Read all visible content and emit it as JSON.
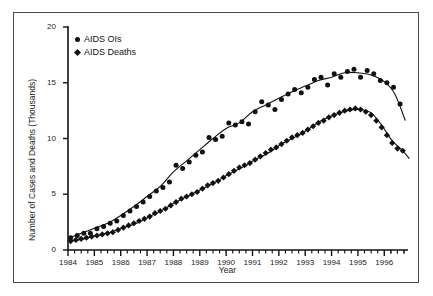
{
  "chart_data": {
    "type": "scatter",
    "title": "",
    "xlabel": "Year",
    "ylabel": "Number of Cases and Deaths (Thousands)",
    "xlim": [
      1984.0,
      1996.9
    ],
    "ylim": [
      0,
      20
    ],
    "yticks": [
      0,
      5,
      10,
      15,
      20
    ],
    "ytick_labels": [
      "0",
      "5",
      "10",
      "15",
      "20"
    ],
    "xticks": [
      1984,
      1985,
      1986,
      1987,
      1988,
      1989,
      1990,
      1991,
      1992,
      1993,
      1994,
      1995,
      1996
    ],
    "xtick_labels": [
      "1984",
      "1985",
      "1986",
      "1987",
      "1988",
      "1989",
      "1990",
      "1991",
      "1992",
      "1993",
      "1994",
      "1995",
      "1996"
    ],
    "minor_xticks_per_year": 4,
    "grid": false,
    "legend_position": "upper left",
    "marker_color": "#111111",
    "trend_line_color": "#111111",
    "series": [
      {
        "name": "AIDS OIs",
        "marker": "circle",
        "x": [
          1984.1,
          1984.35,
          1984.6,
          1984.85,
          1985.1,
          1985.35,
          1985.6,
          1985.85,
          1986.1,
          1986.35,
          1986.6,
          1986.85,
          1987.1,
          1987.35,
          1987.6,
          1987.85,
          1988.1,
          1988.35,
          1988.6,
          1988.85,
          1989.1,
          1989.35,
          1989.6,
          1989.85,
          1990.1,
          1990.35,
          1990.6,
          1990.85,
          1991.1,
          1991.35,
          1991.6,
          1991.85,
          1992.1,
          1992.35,
          1992.6,
          1992.85,
          1993.1,
          1993.35,
          1993.6,
          1993.85,
          1994.1,
          1994.35,
          1994.6,
          1994.85,
          1995.1,
          1995.35,
          1995.6,
          1995.85,
          1996.1,
          1996.35,
          1996.6
        ],
        "y": [
          1.1,
          1.3,
          1.5,
          1.5,
          1.9,
          2.1,
          2.4,
          2.6,
          3.1,
          3.5,
          3.9,
          4.3,
          4.8,
          5.3,
          5.6,
          6.1,
          7.6,
          7.3,
          7.9,
          8.5,
          8.8,
          10.1,
          9.9,
          10.2,
          11.4,
          11.2,
          11.5,
          11.3,
          12.4,
          13.3,
          13.0,
          12.6,
          13.5,
          14.0,
          14.4,
          14.1,
          14.6,
          15.3,
          15.5,
          14.8,
          15.8,
          15.5,
          16.0,
          16.2,
          15.5,
          16.1,
          15.8,
          15.2,
          15.0,
          14.6,
          13.1
        ]
      },
      {
        "name": "AIDS Deaths",
        "marker": "diamond",
        "x": [
          1984.1,
          1984.3,
          1984.5,
          1984.7,
          1984.9,
          1985.1,
          1985.3,
          1985.5,
          1985.7,
          1985.9,
          1986.1,
          1986.3,
          1986.5,
          1986.7,
          1986.9,
          1987.1,
          1987.3,
          1987.5,
          1987.7,
          1987.9,
          1988.1,
          1988.3,
          1988.5,
          1988.7,
          1988.9,
          1989.1,
          1989.3,
          1989.5,
          1989.7,
          1989.9,
          1990.1,
          1990.3,
          1990.5,
          1990.7,
          1990.9,
          1991.1,
          1991.3,
          1991.5,
          1991.7,
          1991.9,
          1992.1,
          1992.3,
          1992.5,
          1992.7,
          1992.9,
          1993.1,
          1993.3,
          1993.5,
          1993.7,
          1993.9,
          1994.1,
          1994.3,
          1994.5,
          1994.7,
          1994.9,
          1995.1,
          1995.3,
          1995.5,
          1995.7,
          1995.9,
          1996.1,
          1996.3,
          1996.5,
          1996.7
        ],
        "y": [
          0.8,
          0.9,
          1.0,
          1.1,
          1.2,
          1.3,
          1.4,
          1.5,
          1.6,
          1.8,
          2.0,
          2.2,
          2.4,
          2.6,
          2.8,
          3.0,
          3.3,
          3.5,
          3.7,
          4.0,
          4.3,
          4.6,
          4.8,
          5.0,
          5.2,
          5.5,
          5.8,
          6.0,
          6.2,
          6.5,
          6.8,
          7.1,
          7.4,
          7.6,
          7.8,
          8.1,
          8.4,
          8.7,
          9.0,
          9.2,
          9.5,
          9.8,
          10.1,
          10.3,
          10.5,
          10.8,
          11.1,
          11.4,
          11.6,
          11.9,
          12.1,
          12.3,
          12.5,
          12.6,
          12.7,
          12.6,
          12.4,
          12.1,
          11.6,
          11.0,
          10.3,
          9.6,
          9.1,
          8.9
        ]
      }
    ],
    "trend_lines": [
      {
        "series": "AIDS OIs",
        "x": [
          1984.1,
          1984.5,
          1985.0,
          1985.5,
          1986.0,
          1986.5,
          1987.0,
          1987.5,
          1988.0,
          1988.5,
          1989.0,
          1989.5,
          1990.0,
          1990.5,
          1991.0,
          1991.5,
          1992.0,
          1992.5,
          1993.0,
          1993.5,
          1994.0,
          1994.5,
          1995.0,
          1995.5,
          1996.0,
          1996.4,
          1996.8
        ],
        "y": [
          1.15,
          1.5,
          1.95,
          2.4,
          3.1,
          3.9,
          4.8,
          5.7,
          7.0,
          8.0,
          9.0,
          10.0,
          10.9,
          11.4,
          12.4,
          13.0,
          13.6,
          14.2,
          14.7,
          15.2,
          15.5,
          15.9,
          15.9,
          15.7,
          15.1,
          14.0,
          11.6
        ]
      },
      {
        "series": "AIDS Deaths",
        "x": [
          1984.1,
          1984.6,
          1985.1,
          1985.6,
          1986.1,
          1986.6,
          1987.1,
          1987.6,
          1988.1,
          1988.6,
          1989.1,
          1989.6,
          1990.1,
          1990.6,
          1991.1,
          1991.6,
          1992.1,
          1992.6,
          1993.1,
          1993.6,
          1994.1,
          1994.6,
          1995.1,
          1995.5,
          1995.9,
          1996.3,
          1996.7,
          1996.95
        ],
        "y": [
          0.8,
          1.0,
          1.3,
          1.6,
          2.0,
          2.4,
          3.0,
          3.6,
          4.3,
          4.9,
          5.5,
          6.1,
          6.8,
          7.4,
          8.1,
          8.7,
          9.5,
          10.1,
          10.8,
          11.6,
          12.1,
          12.5,
          12.6,
          12.3,
          11.2,
          9.8,
          8.9,
          8.2
        ]
      }
    ]
  },
  "legend": {
    "items": [
      {
        "label": "AIDS OIs",
        "marker": "circle"
      },
      {
        "label": "AIDS Deaths",
        "marker": "diamond"
      }
    ]
  }
}
